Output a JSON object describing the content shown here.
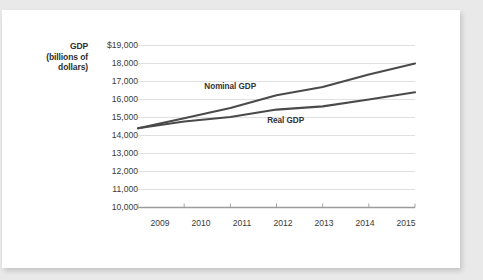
{
  "figure": {
    "background_color": "#e9e9e9",
    "card_color": "#ffffff"
  },
  "chart_data": {
    "type": "line",
    "title": "",
    "subtitle": "",
    "xlabel": "",
    "ylabel": "GDP (billions of dollars)",
    "ylabel_lines": [
      "GDP",
      "(billions of",
      "dollars)"
    ],
    "grid": true,
    "legend_position": "inline-annotations",
    "x": [
      2009,
      2010,
      2011,
      2012,
      2013,
      2014,
      2015
    ],
    "categories": [
      "2009",
      "2010",
      "2011",
      "2012",
      "2013",
      "2014",
      "2015"
    ],
    "xlim": [
      2009,
      2015
    ],
    "ylim": [
      10000,
      19000
    ],
    "ytick_labels": [
      "$19,000",
      "18,000",
      "17,000",
      "16,000",
      "15,000",
      "14,000",
      "13,000",
      "12,000",
      "11,000",
      "10,000"
    ],
    "ytick_values": [
      19000,
      18000,
      17000,
      16000,
      15000,
      14000,
      13000,
      12000,
      11000,
      10000
    ],
    "currency_prefix": "$",
    "series": [
      {
        "name": "Nominal GDP",
        "color": "#4a4a4a",
        "label_x": 2011.0,
        "label_y": 16700,
        "values": [
          14400,
          14960,
          15530,
          16240,
          16690,
          17390,
          18000
        ]
      },
      {
        "name": "Real GDP",
        "color": "#4a4a4a",
        "label_x": 2012.2,
        "label_y": 14780,
        "values": [
          14400,
          14780,
          15030,
          15440,
          15620,
          16000,
          16400
        ]
      }
    ]
  },
  "annotations": [
    {
      "name": "nominal-gdp-label",
      "text": "Nominal GDP"
    },
    {
      "name": "real-gdp-label",
      "text": "Real GDP"
    }
  ]
}
